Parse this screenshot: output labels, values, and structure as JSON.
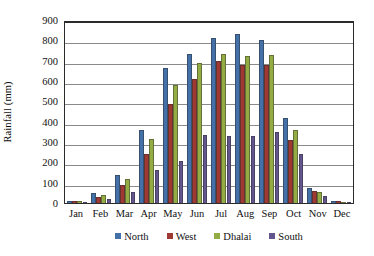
{
  "chart_data": {
    "type": "bar",
    "title": "",
    "xlabel": "",
    "ylabel": "Rainfall (mm)",
    "ylim": [
      0,
      900
    ],
    "ytick_step": 100,
    "yticks": [
      900,
      800,
      700,
      600,
      500,
      400,
      300,
      200,
      100,
      0
    ],
    "grid": true,
    "legend_position": "bottom",
    "categories": [
      "Jan",
      "Feb",
      "Mar",
      "Apr",
      "May",
      "Jun",
      "Jul",
      "Aug",
      "Sep",
      "Oct",
      "Nov",
      "Dec"
    ],
    "series": [
      {
        "name": "North",
        "color": "#4472a8",
        "values": [
          12,
          48,
          140,
          360,
          665,
          735,
          810,
          830,
          800,
          420,
          75,
          10
        ]
      },
      {
        "name": "West",
        "color": "#9e3a33",
        "values": [
          10,
          32,
          90,
          243,
          485,
          610,
          700,
          680,
          680,
          310,
          60,
          8
        ]
      },
      {
        "name": "Dhalai",
        "color": "#94ac44",
        "values": [
          8,
          40,
          120,
          315,
          580,
          690,
          735,
          725,
          730,
          360,
          55,
          6
        ]
      },
      {
        "name": "South",
        "color": "#63568f",
        "values": [
          5,
          20,
          55,
          160,
          205,
          335,
          330,
          330,
          350,
          240,
          35,
          4
        ]
      }
    ]
  },
  "legend": {
    "items": [
      {
        "label": "North",
        "color": "#4472a8"
      },
      {
        "label": "West",
        "color": "#9e3a33"
      },
      {
        "label": "Dhalai",
        "color": "#94ac44"
      },
      {
        "label": "South",
        "color": "#63568f"
      }
    ]
  }
}
